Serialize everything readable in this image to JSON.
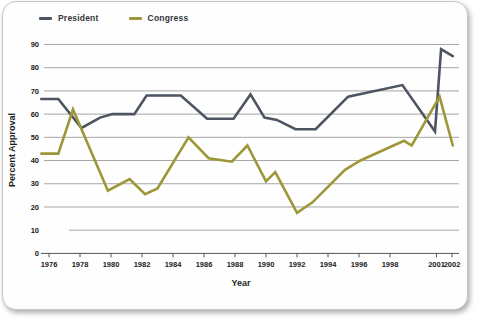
{
  "chart_data": {
    "type": "line",
    "title": "",
    "xlabel": "Year",
    "ylabel": "Percent Approval",
    "ylim": [
      0,
      90
    ],
    "ytick_interval": 10,
    "xticks": [
      1976,
      1978,
      1980,
      1982,
      1984,
      1986,
      1988,
      1990,
      1992,
      1994,
      1996,
      1998,
      2001,
      2002
    ],
    "grid": "horizontal",
    "legend_position": "top-left",
    "colors": {
      "president_line": "#4c5561",
      "congress_line": "#9d9739",
      "gridline": "#8f8f8f",
      "axis": "#555555",
      "tick_text": "#1b1b1b"
    },
    "series": [
      {
        "name": "President",
        "color": "#4c5561",
        "points": [
          [
            1975.5,
            66.5
          ],
          [
            1976.6,
            66.5
          ],
          [
            1978.1,
            54
          ],
          [
            1979.3,
            58.5
          ],
          [
            1980.1,
            60
          ],
          [
            1981.5,
            60
          ],
          [
            1982.3,
            68
          ],
          [
            1984.5,
            68
          ],
          [
            1986.2,
            58
          ],
          [
            1987.9,
            58
          ],
          [
            1989.0,
            68.5
          ],
          [
            1989.9,
            58.5
          ],
          [
            1990.7,
            57.5
          ],
          [
            1991.9,
            53.5
          ],
          [
            1993.2,
            53.5
          ],
          [
            1995.3,
            67.5
          ],
          [
            1998.8,
            72.5
          ],
          [
            2000.9,
            52.5
          ],
          [
            2001.3,
            88
          ],
          [
            2002.05,
            85
          ]
        ]
      },
      {
        "name": "Congress",
        "color": "#9d9739",
        "points": [
          [
            1975.5,
            43
          ],
          [
            1976.6,
            43
          ],
          [
            1977.55,
            62
          ],
          [
            1979.8,
            27
          ],
          [
            1981.2,
            32
          ],
          [
            1982.2,
            25.5
          ],
          [
            1983.0,
            28
          ],
          [
            1985.0,
            50
          ],
          [
            1986.3,
            41
          ],
          [
            1987.8,
            39.5
          ],
          [
            1988.8,
            46.5
          ],
          [
            1990.0,
            31
          ],
          [
            1990.6,
            35
          ],
          [
            1992.0,
            17.5
          ],
          [
            1993.0,
            22
          ],
          [
            1995.1,
            36
          ],
          [
            1996.1,
            40
          ],
          [
            1998.9,
            48.5
          ],
          [
            1999.4,
            46.5
          ],
          [
            2001.2,
            67.5
          ],
          [
            2002.05,
            46.5
          ]
        ]
      }
    ]
  }
}
